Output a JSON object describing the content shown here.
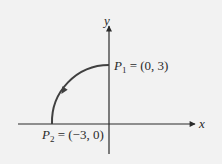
{
  "diagram": {
    "type": "coordinate-plane-arc",
    "axes": {
      "x_label": "x",
      "y_label": "y"
    },
    "points": [
      {
        "name": "P",
        "subscript": "1",
        "eq": " = (0, 3)",
        "x": 0,
        "y": 3
      },
      {
        "name": "P",
        "subscript": "2",
        "eq": " = (−3, 0)",
        "x": -3,
        "y": 0
      }
    ],
    "arc": {
      "description": "Quarter circle of radius 3 centered at origin, traversed counterclockwise from P1 to P2",
      "radius": 3,
      "direction": "counterclockwise",
      "from": "P1",
      "to": "P2"
    },
    "colors": {
      "background": "#f2f2f2",
      "axis": "#2a2a2a",
      "arc": "#404040",
      "text": "#2a2a2a"
    }
  }
}
